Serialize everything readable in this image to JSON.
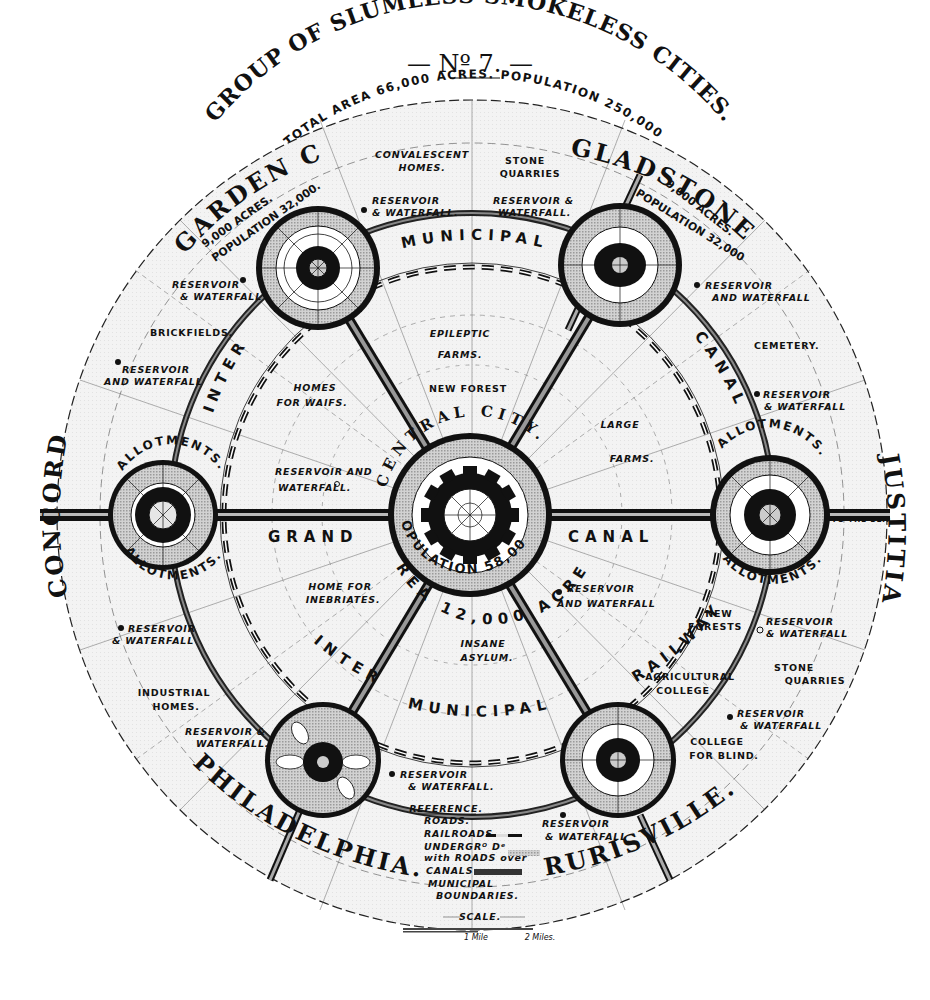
{
  "header": {
    "number": "— Nº 7. —",
    "title_left": "GROUP OF SLUMLESS",
    "title_right": "SMOKELESS CITIES.",
    "total_area": "TOTAL AREA 66,000 ACRES.",
    "population": "POPULATION 250,000"
  },
  "central_city": {
    "name": "CENTRAL CITY.",
    "population_label": "POPULATION 58,000",
    "area_label": "AREA 12,000 ACRES"
  },
  "satellite_cities": [
    {
      "id": "garden-city",
      "name": "GARDEN CITY.",
      "acres": "9,000 ACRES.",
      "population": "POPULATION 32,000."
    },
    {
      "id": "gladstone",
      "name": "GLADSTONE",
      "acres": "9,000 ACRES.",
      "population": "POPULATION 32,000"
    },
    {
      "id": "concord",
      "name": "CONCORD"
    },
    {
      "id": "justitia",
      "name": "JUSTITIA"
    },
    {
      "id": "philadelphia",
      "name": "PHILADELPHIA."
    },
    {
      "id": "rurisville",
      "name": "RURISVILLE."
    }
  ],
  "ring_labels": {
    "inter_municipal_canal_top": "MUNICIPAL",
    "inter_left": "INTER",
    "canal_right": "CANAL",
    "grand": "GRAND",
    "canal_east": "CANAL",
    "railway_bottom_inter": "INTER",
    "railway_bottom_municipal": "MUNICIPAL",
    "railway_bottom_railway": "RAILWAY",
    "allotments": "ALLOTMENTS.",
    "to_the_sea": "TO THE SEA"
  },
  "areas": {
    "convalescent": [
      "CONVALESCENT",
      "HOMES."
    ],
    "stone_quarries_top": [
      "STONE",
      "QUARRIES"
    ],
    "reservoir_top_left": [
      "RESERVOIR",
      "& WATERFALL."
    ],
    "reservoir_top_right": [
      "RESERVOIR &",
      "WATERFALL."
    ],
    "reservoir_gc": [
      "RESERVOIR",
      "& WATERFALL"
    ],
    "brickfields": "BRICKFIELDS.",
    "reservoir_far_left": [
      "RESERVOIR",
      "AND WATERFALL"
    ],
    "reservoir_gl": [
      "RESERVOIR",
      "AND WATERFALL"
    ],
    "cemetery": "CEMETERY.",
    "reservoir_right": [
      "RESERVOIR",
      "& WATERFALL"
    ],
    "epileptic": [
      "EPILEPTIC",
      "FARMS."
    ],
    "new_forest": "NEW FOREST",
    "homes_waifs": [
      "HOMES",
      "FOR WAIFS."
    ],
    "large_farms": [
      "LARGE",
      "FARMS."
    ],
    "reservoir_inner_left": [
      "RESERVOIR AND",
      "WATERFALL."
    ],
    "inebriates": [
      "HOME FOR",
      "INEBRIATES."
    ],
    "reservoir_inner_right": [
      "RESERVOIR",
      "AND WATERFALL"
    ],
    "insane": [
      "INSANE",
      "ASYLUM."
    ],
    "reservoir_left_low": [
      "RESERVOIR",
      "& WATERFALL"
    ],
    "industrial": [
      "INDUSTRIAL",
      "HOMES."
    ],
    "reservoir_ph": [
      "RESERVOIR &",
      "WATERFALL."
    ],
    "reservoir_bottom": [
      "RESERVOIR",
      "& WATERFALL."
    ],
    "new_forests": [
      "NEW",
      "FORESTS"
    ],
    "reservoir_right_low": [
      "RESERVOIR",
      "& WATERFALL"
    ],
    "stone_quarries_right": [
      "STONE",
      "QUARRIES"
    ],
    "agricultural": [
      "AGRICULTURAL",
      "COLLEGE"
    ],
    "reservoir_right_lower": [
      "RESERVOIR",
      "& WATERFALL"
    ],
    "college_blind": [
      "COLLEGE",
      "FOR BLIND."
    ],
    "reservoir_ru": [
      "RESERVOIR",
      "& WATERFALL"
    ]
  },
  "legend": {
    "title": "REFERENCE.",
    "items": [
      "ROADS.",
      "RAILROADS.",
      "UNDERGRᴼ Dᵉ",
      "with ROADS over",
      "CANALS",
      "MUNICIPAL",
      "BOUNDARIES."
    ]
  },
  "scale": {
    "title": "SCALE.",
    "marks": [
      "1 Mile",
      "2 Miles."
    ]
  },
  "colors": {
    "ink": "#111111",
    "paper": "#f4f4f4",
    "shade": "#bdbdbd",
    "background": "#ffffff"
  }
}
